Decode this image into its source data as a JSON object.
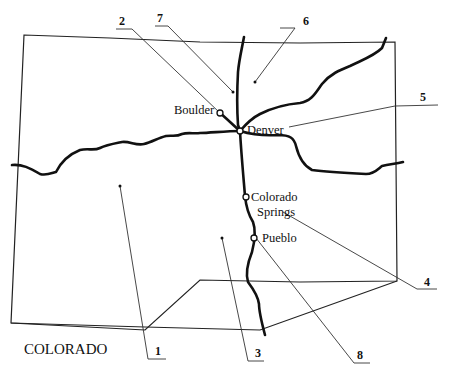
{
  "title": "COLORADO",
  "cities": [
    {
      "name": "Boulder",
      "label": "Boulder"
    },
    {
      "name": "Denver",
      "label": "Denver"
    },
    {
      "name": "Colorado Springs",
      "label_line1": "Colorado",
      "label_line2": "Springs"
    },
    {
      "name": "Pueblo",
      "label": "Pueblo"
    }
  ],
  "callouts": [
    {
      "number": "1"
    },
    {
      "number": "2"
    },
    {
      "number": "3"
    },
    {
      "number": "4"
    },
    {
      "number": "5"
    },
    {
      "number": "6"
    },
    {
      "number": "7"
    },
    {
      "number": "8"
    }
  ],
  "colors": {
    "line": "#111111",
    "background": "#ffffff"
  }
}
